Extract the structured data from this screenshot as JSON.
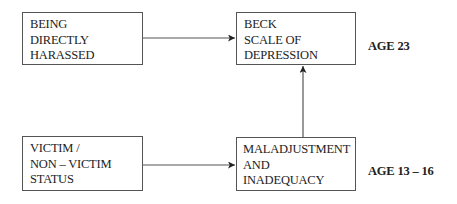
{
  "diagram": {
    "nodes": [
      {
        "id": "being-directly-harassed",
        "lines": [
          "BEING",
          "DIRECTLY",
          "HARASSED"
        ]
      },
      {
        "id": "beck-scale-of-depression",
        "lines": [
          "BECK",
          "SCALE OF",
          "DEPRESSION"
        ]
      },
      {
        "id": "victim-status",
        "lines": [
          "VICTIM /",
          "NON – VICTIM",
          "STATUS"
        ]
      },
      {
        "id": "maladjustment-and-inadequacy",
        "lines": [
          "MALADJUSTMENT",
          "AND",
          "INADEQUACY"
        ]
      }
    ],
    "edges": [
      {
        "from": "being-directly-harassed",
        "to": "beck-scale-of-depression"
      },
      {
        "from": "victim-status",
        "to": "maladjustment-and-inadequacy"
      },
      {
        "from": "maladjustment-and-inadequacy",
        "to": "beck-scale-of-depression"
      }
    ],
    "age_labels": {
      "top": "AGE 23",
      "bottom": "AGE 13 – 16"
    },
    "colors": {
      "line": "#555555",
      "text": "#222222",
      "background": "#ffffff"
    }
  }
}
